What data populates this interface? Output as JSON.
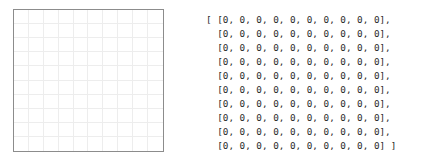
{
  "canvas": {
    "width": 439,
    "height": 166,
    "background_color": "#ffffff"
  },
  "grid": {
    "rows": 10,
    "cols": 10,
    "border_color": "#8c8c8c",
    "gridline_color": "#ededed",
    "cell_fill_color": "#ffffff",
    "empty_cell_label": ""
  },
  "matrix": {
    "open_bracket": "[ ",
    "close_bracket": " ]",
    "lines": [
      "[ [0, 0, 0, 0, 0, 0, 0, 0, 0, 0],",
      "  [0, 0, 0, 0, 0, 0, 0, 0, 0, 0],",
      "  [0, 0, 0, 0, 0, 0, 0, 0, 0, 0],",
      "  [0, 0, 0, 0, 0, 0, 0, 0, 0, 0],",
      "  [0, 0, 0, 0, 0, 0, 0, 0, 0, 0],",
      "  [0, 0, 0, 0, 0, 0, 0, 0, 0, 0],",
      "  [0, 0, 0, 0, 0, 0, 0, 0, 0, 0],",
      "  [0, 0, 0, 0, 0, 0, 0, 0, 0, 0],",
      "  [0, 0, 0, 0, 0, 0, 0, 0, 0, 0],",
      "  [0, 0, 0, 0, 0, 0, 0, 0, 0, 0] ]"
    ],
    "text_color": "#2b2b2b",
    "values": [
      [
        0,
        0,
        0,
        0,
        0,
        0,
        0,
        0,
        0,
        0
      ],
      [
        0,
        0,
        0,
        0,
        0,
        0,
        0,
        0,
        0,
        0
      ],
      [
        0,
        0,
        0,
        0,
        0,
        0,
        0,
        0,
        0,
        0
      ],
      [
        0,
        0,
        0,
        0,
        0,
        0,
        0,
        0,
        0,
        0
      ],
      [
        0,
        0,
        0,
        0,
        0,
        0,
        0,
        0,
        0,
        0
      ],
      [
        0,
        0,
        0,
        0,
        0,
        0,
        0,
        0,
        0,
        0
      ],
      [
        0,
        0,
        0,
        0,
        0,
        0,
        0,
        0,
        0,
        0
      ],
      [
        0,
        0,
        0,
        0,
        0,
        0,
        0,
        0,
        0,
        0
      ],
      [
        0,
        0,
        0,
        0,
        0,
        0,
        0,
        0,
        0,
        0
      ],
      [
        0,
        0,
        0,
        0,
        0,
        0,
        0,
        0,
        0,
        0
      ]
    ]
  }
}
